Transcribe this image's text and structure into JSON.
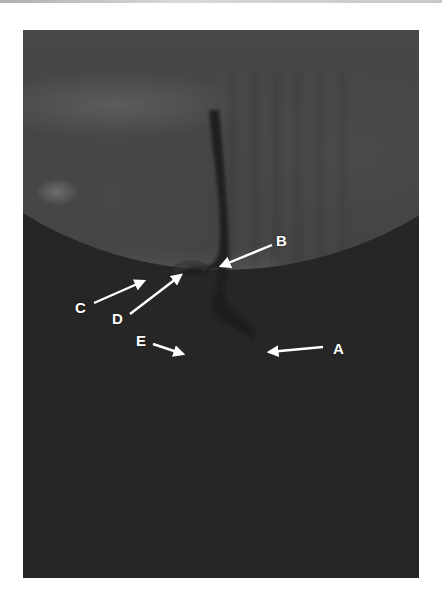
{
  "figure": {
    "type": "lateral fluoroscopic swallow study image",
    "annotations": [
      {
        "id": "A",
        "label": "A",
        "label_x": 333,
        "label_y": 349,
        "arrow_from": [
          323,
          347
        ],
        "arrow_to": [
          268,
          352
        ]
      },
      {
        "id": "B",
        "label": "B",
        "label_x": 283,
        "label_y": 241,
        "arrow_from": [
          272,
          245
        ],
        "arrow_to": [
          220,
          266
        ]
      },
      {
        "id": "C",
        "label": "C",
        "label_x": 81,
        "label_y": 307,
        "arrow_from": [
          94,
          303
        ],
        "arrow_to": [
          144,
          281
        ]
      },
      {
        "id": "D",
        "label": "D",
        "label_x": 117,
        "label_y": 318,
        "arrow_from": [
          130,
          314
        ],
        "arrow_to": [
          181,
          275
        ]
      },
      {
        "id": "E",
        "label": "E",
        "label_x": 141,
        "label_y": 341,
        "arrow_from": [
          153,
          344
        ],
        "arrow_to": [
          183,
          354
        ]
      }
    ],
    "colors": {
      "background": "#ffffff",
      "image_dark": "#2b2b2b",
      "image_mid": "#474747",
      "airway_bright": "#ffffff",
      "arrow": "#ffffff"
    }
  }
}
